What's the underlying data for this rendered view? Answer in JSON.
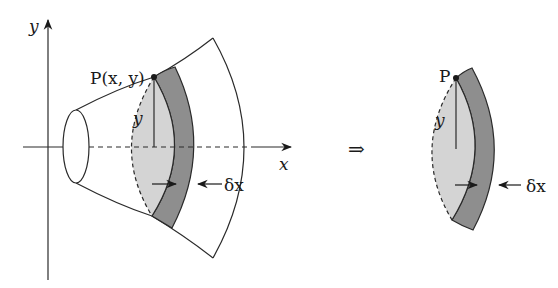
{
  "figure": {
    "colors": {
      "line": "#2a2a2a",
      "disc_face": "#d4d4d4",
      "disc_rim": "#8e8e8e",
      "background": "#ffffff"
    },
    "left_panel": {
      "axis_y_label": "y",
      "axis_x_label": "x",
      "point_label": "P(x, y)",
      "radius_label": "y",
      "thickness_label": "δx"
    },
    "implies_symbol": "⇒",
    "right_panel": {
      "point_label": "P",
      "radius_label": "y",
      "thickness_label": "δx"
    }
  }
}
